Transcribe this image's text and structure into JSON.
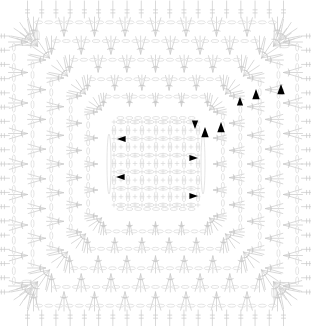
{
  "document": {
    "type": "crochet-pattern-chart",
    "title": "Square Motif Crochet Diagram",
    "width": 311,
    "height": 326
  },
  "style": {
    "background": "#ffffff",
    "stitch_color": "#c9c9c9",
    "stitch_color_light": "#d8d8d8",
    "marker_color": "#000000",
    "stroke_width": 0.7
  },
  "legend": {
    "symbols": [
      {
        "name": "chain-stitch",
        "glyph": "oval",
        "description": "chain"
      },
      {
        "name": "single-crochet",
        "glyph": "plus",
        "description": "single crochet"
      },
      {
        "name": "double-crochet",
        "glyph": "t-bar",
        "description": "double crochet"
      },
      {
        "name": "round-start-marker",
        "glyph": "triangle",
        "description": "round start / direction"
      }
    ]
  },
  "chart_data": {
    "type": "diagram",
    "rounds": 11,
    "symmetry": "4-fold square",
    "center_grid": {
      "columns": 13,
      "rows": 11
    },
    "markers": [
      {
        "id": "m1",
        "x": 240,
        "y": 102,
        "rotation": 0,
        "size": 5
      },
      {
        "id": "m2",
        "x": 256,
        "y": 95,
        "rotation": 0,
        "size": 6
      },
      {
        "id": "m3",
        "x": 281,
        "y": 90,
        "rotation": 0,
        "size": 6
      },
      {
        "id": "m4",
        "x": 205,
        "y": 133,
        "rotation": 0,
        "size": 6
      },
      {
        "id": "m5",
        "x": 221,
        "y": 128,
        "rotation": 0,
        "size": 6
      },
      {
        "id": "m6",
        "x": 195,
        "y": 124,
        "rotation": 180,
        "size": 5
      },
      {
        "id": "m7",
        "x": 193,
        "y": 158,
        "rotation": 90,
        "size": 5
      },
      {
        "id": "m8",
        "x": 193,
        "y": 196,
        "rotation": 90,
        "size": 5
      },
      {
        "id": "m9",
        "x": 122,
        "y": 139,
        "rotation": 270,
        "size": 5
      },
      {
        "id": "m10",
        "x": 121,
        "y": 177,
        "rotation": 270,
        "size": 5
      }
    ]
  }
}
